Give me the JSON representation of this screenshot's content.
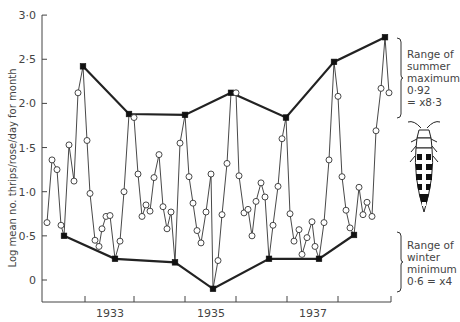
{
  "chart_data": {
    "type": "line",
    "title": "",
    "ylabel": "Log mean no. thrips/rose/day for month",
    "xlabel": "",
    "ylim": [
      -0.1,
      3.0
    ],
    "yticks": [
      {
        "v": 0,
        "label": "0"
      },
      {
        "v": 0.5,
        "label": "0·5"
      },
      {
        "v": 1.0,
        "label": "1·0"
      },
      {
        "v": 1.5,
        "label": "1·5"
      },
      {
        "v": 2.0,
        "label": "2·0"
      },
      {
        "v": 2.5,
        "label": "2·5"
      },
      {
        "v": 3.0,
        "label": "3·0"
      }
    ],
    "xtick_px": [
      85,
      134,
      185,
      236,
      287,
      338,
      391
    ],
    "xlabels": [
      {
        "label": "1933",
        "x": 110
      },
      {
        "label": "1935",
        "x": 211
      },
      {
        "label": "1937",
        "x": 313
      }
    ],
    "grid": false,
    "series": [
      {
        "name": "Monthly log mean thrips per rose per day",
        "points": [
          [
            47,
            0.65,
            "o"
          ],
          [
            52,
            1.36,
            "o"
          ],
          [
            57,
            1.25,
            "o"
          ],
          [
            61,
            0.62,
            "o"
          ],
          [
            64,
            0.5,
            "s"
          ],
          [
            69,
            1.53,
            "o"
          ],
          [
            74,
            1.12,
            "o"
          ],
          [
            78,
            2.12,
            "o"
          ],
          [
            83,
            2.42,
            "s"
          ],
          [
            87,
            1.58,
            "o"
          ],
          [
            90,
            0.98,
            "o"
          ],
          [
            95,
            0.45,
            "o"
          ],
          [
            99,
            0.38,
            "o"
          ],
          [
            102,
            0.58,
            "o"
          ],
          [
            106,
            0.72,
            "o"
          ],
          [
            110,
            0.73,
            "o"
          ],
          [
            115,
            0.24,
            "s"
          ],
          [
            120,
            0.44,
            "o"
          ],
          [
            124,
            1.0,
            "o"
          ],
          [
            129,
            1.88,
            "s"
          ],
          [
            134,
            1.84,
            "o"
          ],
          [
            138,
            1.2,
            "o"
          ],
          [
            142,
            0.72,
            "o"
          ],
          [
            146,
            0.85,
            "o"
          ],
          [
            150,
            0.78,
            "o"
          ],
          [
            154,
            1.16,
            "o"
          ],
          [
            159,
            1.42,
            "o"
          ],
          [
            163,
            0.83,
            "o"
          ],
          [
            167,
            0.58,
            "o"
          ],
          [
            171,
            0.77,
            "o"
          ],
          [
            175,
            0.2,
            "s"
          ],
          [
            180,
            1.55,
            "o"
          ],
          [
            185,
            1.87,
            "s"
          ],
          [
            189,
            1.17,
            "o"
          ],
          [
            193,
            0.87,
            "o"
          ],
          [
            197,
            0.56,
            "o"
          ],
          [
            201,
            0.42,
            "o"
          ],
          [
            206,
            0.77,
            "o"
          ],
          [
            211,
            1.2,
            "o"
          ],
          [
            213,
            -0.1,
            "s"
          ],
          [
            218,
            0.22,
            "o"
          ],
          [
            222,
            0.74,
            "o"
          ],
          [
            227,
            1.32,
            "o"
          ],
          [
            231,
            2.12,
            "s"
          ],
          [
            236,
            2.12,
            "o"
          ],
          [
            239,
            1.18,
            "o"
          ],
          [
            244,
            0.76,
            "o"
          ],
          [
            248,
            0.8,
            "o"
          ],
          [
            252,
            0.5,
            "o"
          ],
          [
            256,
            0.89,
            "o"
          ],
          [
            261,
            1.1,
            "o"
          ],
          [
            265,
            0.94,
            "o"
          ],
          [
            269,
            0.24,
            "s"
          ],
          [
            273,
            0.62,
            "o"
          ],
          [
            278,
            1.06,
            "o"
          ],
          [
            282,
            1.6,
            "o"
          ],
          [
            286,
            1.84,
            "s"
          ],
          [
            290,
            0.75,
            "o"
          ],
          [
            294,
            0.44,
            "o"
          ],
          [
            299,
            0.57,
            "o"
          ],
          [
            302,
            0.29,
            "o"
          ],
          [
            307,
            0.48,
            "o"
          ],
          [
            312,
            0.66,
            "o"
          ],
          [
            315,
            0.38,
            "o"
          ],
          [
            319,
            0.24,
            "s"
          ],
          [
            324,
            0.65,
            "o"
          ],
          [
            329,
            1.36,
            "o"
          ],
          [
            334,
            2.47,
            "s"
          ],
          [
            338,
            2.08,
            "o"
          ],
          [
            342,
            1.17,
            "o"
          ],
          [
            346,
            0.79,
            "o"
          ],
          [
            350,
            0.59,
            "o"
          ],
          [
            354,
            0.51,
            "s"
          ],
          [
            359,
            1.05,
            "o"
          ],
          [
            363,
            0.74,
            "o"
          ],
          [
            367,
            0.88,
            "o"
          ],
          [
            372,
            0.72,
            "o"
          ],
          [
            376,
            1.69,
            "o"
          ],
          [
            381,
            2.17,
            "o"
          ],
          [
            385,
            2.75,
            "s"
          ],
          [
            389,
            2.12,
            "o"
          ]
        ]
      },
      {
        "name": "Summer maxima envelope",
        "points": [
          [
            83,
            2.42
          ],
          [
            129,
            1.88
          ],
          [
            185,
            1.87
          ],
          [
            231,
            2.12
          ],
          [
            286,
            1.84
          ],
          [
            334,
            2.47
          ],
          [
            385,
            2.75
          ]
        ]
      },
      {
        "name": "Winter minima envelope",
        "points": [
          [
            64,
            0.5
          ],
          [
            115,
            0.24
          ],
          [
            175,
            0.2
          ],
          [
            213,
            -0.1
          ],
          [
            269,
            0.24
          ],
          [
            319,
            0.24
          ],
          [
            354,
            0.51
          ]
        ]
      }
    ],
    "annotations": [
      {
        "lines": [
          "Range of",
          "summer",
          "maximum",
          "0·92",
          "= x8·3"
        ],
        "bracket": [
          38,
          118
        ]
      },
      {
        "lines": [
          "Range of",
          "winter",
          "minimum",
          "0·6 = x4"
        ],
        "bracket": [
          232,
          292
        ]
      }
    ]
  },
  "illustration": "thrips-insect"
}
